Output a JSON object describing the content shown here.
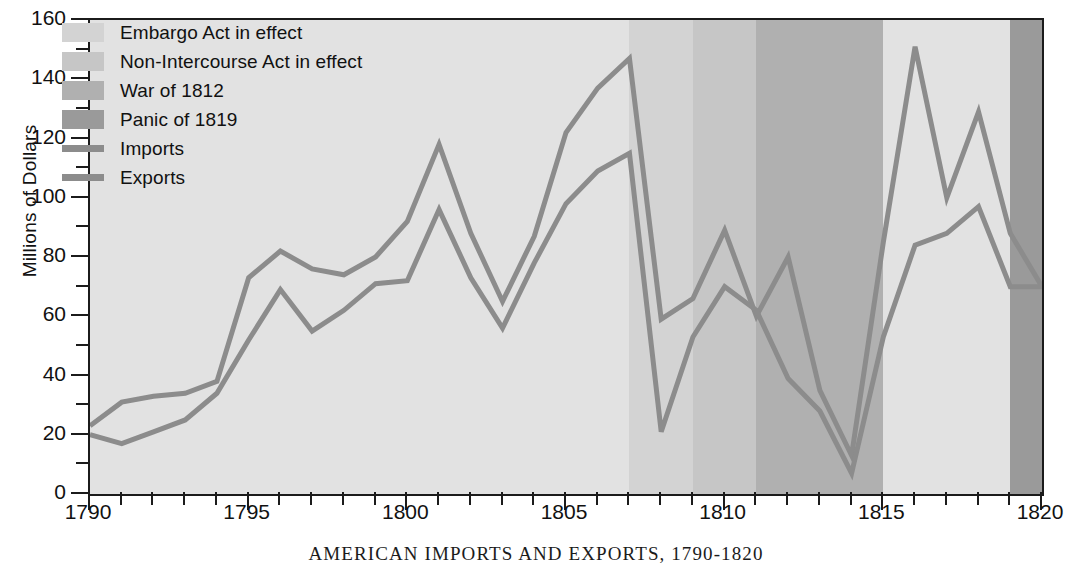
{
  "chart_data": {
    "type": "line",
    "title": "AMERICAN IMPORTS AND EXPORTS, 1790-1820",
    "xlabel": "",
    "ylabel": "Millions of Dollars",
    "xlim": [
      1790,
      1820
    ],
    "ylim": [
      0,
      160
    ],
    "grid": false,
    "legend_position": "top-left inside plot",
    "x_major_ticks": [
      1790,
      1795,
      1800,
      1805,
      1810,
      1815,
      1820
    ],
    "x_tick_labels": [
      "1790",
      "1795",
      "1800",
      "1805",
      "1810",
      "1815",
      "1820"
    ],
    "x_minor_tick_step": 1,
    "y_major_ticks": [
      0,
      20,
      40,
      60,
      80,
      100,
      120,
      140,
      160
    ],
    "y_tick_labels": [
      "0",
      "20",
      "40",
      "60",
      "80",
      "100",
      "120",
      "140",
      "160"
    ],
    "y_minor_tick_step": 10,
    "x": [
      1790,
      1791,
      1792,
      1793,
      1794,
      1795,
      1796,
      1797,
      1798,
      1799,
      1800,
      1801,
      1802,
      1803,
      1804,
      1805,
      1806,
      1807,
      1808,
      1809,
      1810,
      1811,
      1812,
      1813,
      1814,
      1815,
      1816,
      1817,
      1818,
      1819,
      1820
    ],
    "series": [
      {
        "name": "Imports",
        "color": "#8c8c8c",
        "values": [
          23,
          31,
          33,
          34,
          38,
          73,
          82,
          76,
          74,
          80,
          92,
          118,
          88,
          65,
          87,
          122,
          137,
          147,
          59,
          66,
          89,
          60,
          80,
          35,
          13,
          85,
          151,
          100,
          129,
          88,
          70
        ]
      },
      {
        "name": "Exports",
        "color": "#8c8c8c",
        "values": [
          20,
          17,
          21,
          25,
          34,
          52,
          69,
          55,
          62,
          71,
          72,
          96,
          73,
          56,
          78,
          98,
          109,
          115,
          21,
          53,
          70,
          62,
          39,
          28,
          7,
          53,
          84,
          88,
          97,
          70,
          70
        ]
      }
    ],
    "shaded_bands": [
      {
        "name": "Embargo Act in effect",
        "start": 1807,
        "end": 1809,
        "color": "#d3d3d3"
      },
      {
        "name": "Non-Intercourse Act in effect",
        "start": 1809,
        "end": 1811,
        "color": "#c6c6c6"
      },
      {
        "name": "War of 1812",
        "start": 1811,
        "end": 1815,
        "color": "#b0b0b0"
      },
      {
        "name": "Panic of 1819",
        "start": 1819,
        "end": 1820,
        "color": "#9a9a9a"
      }
    ],
    "plot_background": "#e2e2e2"
  },
  "legend": {
    "items": [
      {
        "label": "Embargo Act in effect",
        "kind": "swatch",
        "color": "#d3d3d3"
      },
      {
        "label": "Non-Intercourse Act in effect",
        "kind": "swatch",
        "color": "#c6c6c6"
      },
      {
        "label": "War of 1812",
        "kind": "swatch",
        "color": "#b0b0b0"
      },
      {
        "label": "Panic of 1819",
        "kind": "swatch",
        "color": "#9a9a9a"
      },
      {
        "label": "Imports",
        "kind": "line",
        "color": "#8c8c8c"
      },
      {
        "label": "Exports",
        "kind": "line",
        "color": "#8c8c8c"
      }
    ]
  },
  "axes": {
    "y_title": "Millions of Dollars"
  },
  "caption": {
    "text": "AMERICAN IMPORTS AND EXPORTS, 1790-1820"
  }
}
